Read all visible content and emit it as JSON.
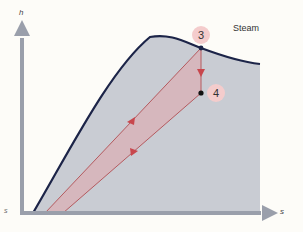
{
  "diagram": {
    "type": "h-s (Mollier) diagram",
    "axes": {
      "y_label": "h",
      "x_label_right": "s",
      "x_label_left": "s"
    },
    "region_label": "Steam",
    "points": [
      {
        "id": "3",
        "label": "3"
      },
      {
        "id": "4",
        "label": "4"
      }
    ],
    "colors": {
      "background": "#fdfcf8",
      "dome_fill": "#c9ccd3",
      "dome_outline": "#1c2448",
      "axis": "#9a9fab",
      "process_band": "#d9a9ad",
      "process_line": "#b55a5f",
      "arrow": "#c8474d",
      "point_badge": "#f4cccc"
    }
  }
}
